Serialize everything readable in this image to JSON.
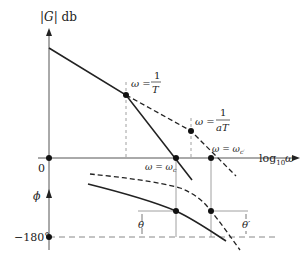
{
  "diagram": {
    "magnitude_axis_label_prefix": "|G|",
    "magnitude_axis_label_unit": "db",
    "frequency_axis_label_base": "log",
    "frequency_axis_label_sub": "10",
    "frequency_axis_label_var": "ω",
    "phase_axis_label": "ϕ",
    "origin_label": "0",
    "phase_min_label": "−180°",
    "corner_1": {
      "lhs": "ω =",
      "num": "1",
      "den": "T"
    },
    "corner_2": {
      "lhs": "ω =",
      "num": "1",
      "den": "aT"
    },
    "crossover_uncompensated": "ω = ω",
    "crossover_uncompensated_sub": "c",
    "crossover_compensated": "ω = ω",
    "crossover_compensated_sub": "c′",
    "phase_margin_uncompensated": "θ",
    "phase_margin_compensated": "θ′",
    "colors": {
      "line": "#222222",
      "guide": "#888888"
    }
  }
}
